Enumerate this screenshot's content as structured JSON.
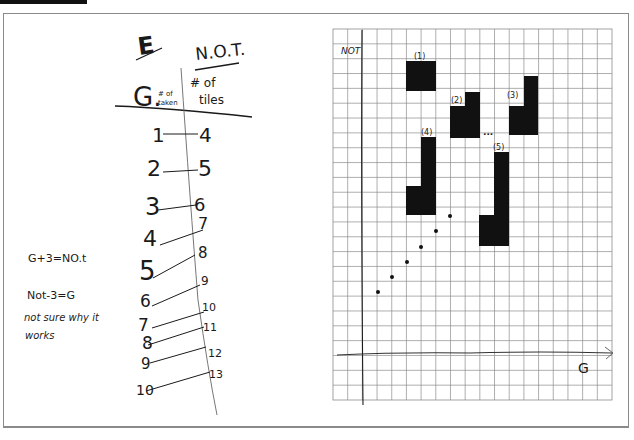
{
  "page": {
    "section_letter": "E"
  },
  "table": {
    "col_g": {
      "label": "G.",
      "sublabel_1": "# of",
      "sublabel_2": "taken"
    },
    "col_not": {
      "label": "N.O.T.",
      "sublabel_1": "# of",
      "sublabel_2": "tiles"
    },
    "rows": [
      {
        "g": "1",
        "not": "4"
      },
      {
        "g": "2",
        "not": "5"
      },
      {
        "g": "3",
        "not": "6"
      },
      {
        "g": "4",
        "not": "7"
      },
      {
        "g": "5",
        "not": "8"
      },
      {
        "g": "6",
        "not": "9"
      },
      {
        "g": "7",
        "not": "10"
      },
      {
        "g": "8",
        "not": "11"
      },
      {
        "g": "9",
        "not": "12"
      },
      {
        "g": "10",
        "not": "13"
      }
    ]
  },
  "notes": {
    "equation_1": "G+3=NO.t",
    "equation_2": "Not-3=G",
    "comment_line_1": "not sure why it",
    "comment_line_2": "works"
  },
  "graph": {
    "y_axis_label": "NOT",
    "x_axis_label": "G",
    "figure_labels": [
      "(1)",
      "(2)",
      "(3)",
      "(4)",
      "(5)"
    ],
    "ellipsis": "..."
  },
  "chart_data": {
    "type": "scatter",
    "title": "",
    "xlabel": "G",
    "ylabel": "NOT",
    "x": [
      1,
      2,
      3,
      4,
      5,
      6
    ],
    "y": [
      4,
      5,
      6,
      7,
      8,
      9
    ],
    "grid": true,
    "annotations": [
      "(1)",
      "(2)",
      "(3)",
      "(4)",
      "(5)",
      "..."
    ]
  },
  "colors": {
    "ink": "#1a1a1a",
    "grid": "#8c8c8c",
    "frame": "#8a8a8a",
    "fill": "#111111"
  }
}
